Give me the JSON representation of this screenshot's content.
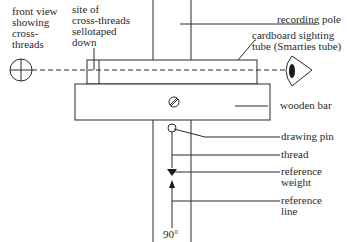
{
  "diagram": {
    "labels": {
      "front_view": "front view\nshowing\ncross-\nthreads",
      "cross_thread_site": "site of\ncross-threads\nsellotaped\ndown",
      "recording_pole": "recording pole",
      "sighting_tube": "cardboard sighting\ntube (Smarties tube)",
      "wooden_bar": "wooden bar",
      "drawing_pin": "drawing pin",
      "thread": "thread",
      "reference_weight": "reference\nweight",
      "reference_line": "reference\nline",
      "angle": "90°"
    },
    "colors": {
      "line": "#2a2a2a",
      "background": "#ffffff"
    }
  }
}
